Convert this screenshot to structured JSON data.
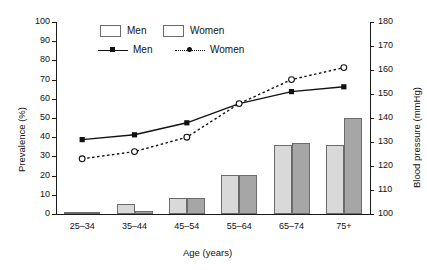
{
  "chart_data": {
    "type": "bar",
    "title": "",
    "categories": [
      "25–34",
      "35–44",
      "45–54",
      "55–64",
      "65–74",
      "75+"
    ],
    "xlabel": "Age (years)",
    "ylabel": "Prevalence (%)",
    "ylim": [
      0,
      100
    ],
    "y2label": "Blood pressure (mmHg)",
    "y2lim": [
      100,
      180
    ],
    "grid": false,
    "legend_position": "top-center",
    "y_ticks": [
      "0",
      "10",
      "20",
      "30",
      "40",
      "50",
      "60",
      "70",
      "80",
      "90",
      "100"
    ],
    "y2_ticks": [
      "100",
      "110",
      "120",
      "130",
      "140",
      "150",
      "160",
      "170",
      "180"
    ],
    "bar_series": [
      {
        "name": "Men",
        "axis": "left",
        "color": "#D9D9D9",
        "values": [
          1,
          5,
          8.5,
          20.5,
          36,
          36
        ]
      },
      {
        "name": "Women",
        "axis": "left",
        "color": "#A6A6A6",
        "values": [
          1,
          1.5,
          8.5,
          20.5,
          37,
          50
        ]
      }
    ],
    "line_series": [
      {
        "name": "Men",
        "axis": "right",
        "style": "solid",
        "marker": "filled-square",
        "values": [
          131,
          133,
          138,
          146,
          151,
          153
        ]
      },
      {
        "name": "Women",
        "axis": "right",
        "style": "dotted",
        "marker": "open-circle",
        "values": [
          123,
          126,
          132,
          146,
          156,
          161
        ]
      }
    ]
  },
  "legend": {
    "bar_men": "Men",
    "bar_women": "Women",
    "line_men": "Men",
    "line_women": "Women"
  }
}
